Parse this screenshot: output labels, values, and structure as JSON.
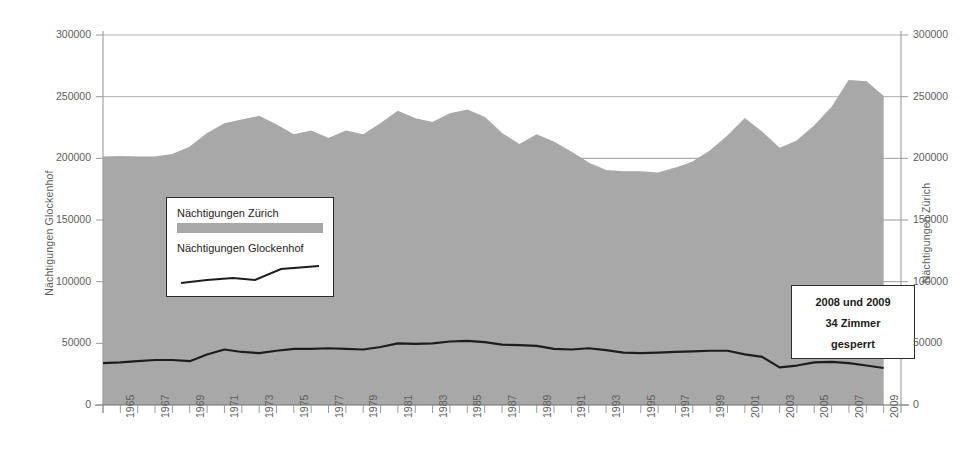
{
  "chart_data": {
    "type": "area",
    "title": "",
    "xlabel": "",
    "ylabel_left": "Nächtigungen Glockenhof",
    "ylabel_right": "Nächtigungen Zürich",
    "grid": true,
    "legend_position": "inside-left",
    "ylim": [
      0,
      300000
    ],
    "ytick_values": [
      0,
      50000,
      100000,
      150000,
      200000,
      250000,
      300000
    ],
    "ytick_labels": [
      "0",
      "50000",
      "100000",
      "150000",
      "200000",
      "250000",
      "300000"
    ],
    "xlim": [
      1964,
      2010
    ],
    "x": [
      1964,
      1965,
      1966,
      1967,
      1968,
      1969,
      1970,
      1971,
      1972,
      1973,
      1974,
      1975,
      1976,
      1977,
      1978,
      1979,
      1980,
      1981,
      1982,
      1983,
      1984,
      1985,
      1986,
      1987,
      1988,
      1989,
      1990,
      1991,
      1992,
      1993,
      1994,
      1995,
      1996,
      1997,
      1998,
      1999,
      2000,
      2001,
      2002,
      2003,
      2004,
      2005,
      2006,
      2007,
      2008,
      2009
    ],
    "xtick_labels": [
      "1965",
      "1967",
      "1969",
      "1971",
      "1973",
      "1975",
      "1977",
      "1979",
      "1981",
      "1983",
      "1985",
      "1987",
      "1989",
      "1991",
      "1993",
      "1995",
      "1997",
      "1999",
      "2001",
      "2003",
      "2005",
      "2007",
      "2009"
    ],
    "xtick_label_years": [
      1965,
      1967,
      1969,
      1971,
      1973,
      1975,
      1977,
      1979,
      1981,
      1983,
      1985,
      1987,
      1989,
      1991,
      1993,
      1995,
      1997,
      1999,
      2001,
      2003,
      2005,
      2007,
      2009
    ],
    "series": [
      {
        "name": "Nächtigungen Zürich",
        "kind": "area",
        "axis": "right",
        "color": "#a8a8a8",
        "values": [
          201000,
          201500,
          201000,
          201000,
          203000,
          209000,
          220000,
          228000,
          231000,
          234000,
          227000,
          219000,
          222000,
          216000,
          222000,
          219000,
          228000,
          238000,
          232000,
          229000,
          236000,
          239000,
          233000,
          220000,
          211000,
          219000,
          213000,
          205000,
          196000,
          190000,
          189000,
          189000,
          188000,
          192000,
          197000,
          206000,
          218000,
          232000,
          221000,
          208000,
          214000,
          226000,
          241000,
          263000,
          262000,
          250000
        ]
      },
      {
        "name": "Nächtigungen Glockenhof",
        "kind": "line",
        "axis": "left",
        "color": "#1d1d1d",
        "values": [
          34000,
          34500,
          35500,
          36500,
          36500,
          35500,
          41000,
          45000,
          43000,
          42000,
          44000,
          45500,
          45500,
          46000,
          45500,
          45000,
          47000,
          50000,
          49500,
          50000,
          51500,
          52000,
          51000,
          49000,
          48500,
          48000,
          45500,
          45000,
          46000,
          44500,
          42500,
          42000,
          42500,
          43000,
          43500,
          44000,
          44000,
          41000,
          39000,
          30500,
          32000,
          34500,
          35000,
          34000,
          32000,
          30000
        ]
      }
    ],
    "annotations": [
      {
        "name": "rooms-closed-note",
        "lines": [
          "2008 und 2009",
          "34 Zimmer",
          "gesperrt"
        ]
      }
    ]
  },
  "legend": {
    "items": [
      {
        "label": "Nächtigungen Zürich",
        "marker": "area-swatch"
      },
      {
        "label": "Nächtigungen Glockenhof",
        "marker": "line-sample"
      }
    ]
  },
  "colors": {
    "area_fill": "#a8a8a8",
    "line": "#1d1d1d",
    "grid": "#8f8f8f",
    "axis": "#9a9a9a",
    "tick_text": "#5d5d5d"
  }
}
